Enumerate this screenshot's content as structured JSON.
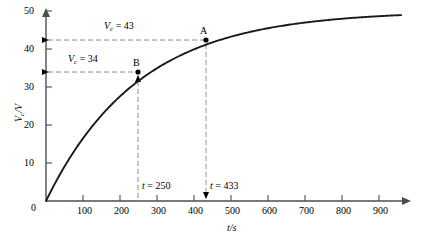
{
  "figure": {
    "name": "capacitor-charging-curve",
    "background": "#ffffff",
    "curve_color": "#1a1a1a",
    "dash_color": "#808080",
    "axis_color": "#4d4d4d",
    "text_color": "#000000"
  },
  "chart_data": {
    "type": "line",
    "title": "",
    "xlabel": "t /s",
    "ylabel": "V_c /V",
    "xlim": [
      0,
      980
    ],
    "ylim": [
      0,
      52
    ],
    "grid": false,
    "legend": null,
    "x_ticks": [
      0,
      100,
      200,
      300,
      400,
      500,
      600,
      700,
      800,
      900
    ],
    "x_tick_labels": [
      "0",
      "100",
      "200",
      "300",
      "400",
      "500",
      "600",
      "700",
      "800",
      "900"
    ],
    "y_ticks": [
      0,
      10,
      20,
      30,
      40,
      50
    ],
    "y_tick_labels": [
      "0",
      "10",
      "20",
      "30",
      "40",
      "50"
    ],
    "series": [
      {
        "name": "Vc(t)",
        "model": "V_inf*(1-exp(-t/tau))",
        "V_inf": 50,
        "tau": 250,
        "x": [
          0,
          25,
          50,
          75,
          100,
          125,
          150,
          175,
          200,
          225,
          250,
          275,
          300,
          350,
          400,
          433,
          450,
          500,
          550,
          600,
          650,
          700,
          750,
          800,
          850,
          900,
          950
        ],
        "y": [
          0,
          4.8,
          9.1,
          13.0,
          16.5,
          19.7,
          22.6,
          25.2,
          27.5,
          29.7,
          31.6,
          33.4,
          34.9,
          37.7,
          39.9,
          41.1,
          41.7,
          43.2,
          44.5,
          45.5,
          46.3,
          46.9,
          47.5,
          47.9,
          48.3,
          48.6,
          48.8
        ],
        "color": "#1a1a1a"
      }
    ],
    "annotations": [
      {
        "id": "A",
        "point_label": "A",
        "t": 433,
        "v": 43,
        "value_label": "Vc = 43",
        "value_label_prefix": "V",
        "value_label_sub": "c",
        "value_label_suffix": " = 43",
        "time_label": "t = 433",
        "time_label_prefix": "t",
        "time_label_suffix": " = 433"
      },
      {
        "id": "B",
        "point_label": "B",
        "t": 250,
        "v": 34,
        "value_label": "Vc = 34",
        "value_label_prefix": "V",
        "value_label_sub": "c",
        "value_label_suffix": " = 34",
        "time_label": "t = 250",
        "time_label_prefix": "t",
        "time_label_suffix": " = 250"
      }
    ]
  },
  "axes": {
    "y_axis_title_prefix": "V",
    "y_axis_title_sub": "c",
    "y_axis_title_suffix": "/V",
    "x_axis_title_prefix": "t",
    "x_axis_title_suffix": "/s"
  }
}
